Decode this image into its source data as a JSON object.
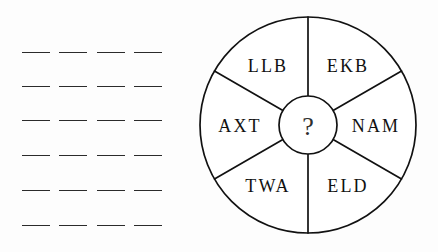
{
  "page": {
    "background_color": "#fdfdfd",
    "ink_color": "#111111"
  },
  "answer_blanks": {
    "label": "answer blanks",
    "rows": 6,
    "dashes_per_row": 4,
    "row_y": [
      52,
      86,
      120,
      155,
      190,
      225
    ],
    "left_x": 22,
    "row_width": 140,
    "dash_width": 28
  },
  "wheel": {
    "label": "word wheel",
    "center": {
      "x": 118,
      "y": 125
    },
    "outer_radius": 108,
    "hub_radius": 29,
    "hub": {
      "text": "?",
      "name": "question-mark"
    },
    "sectors": [
      {
        "name": "sector-ekb",
        "text": "EKB",
        "angle_deg": 60,
        "label_x": 158,
        "label_y": 66
      },
      {
        "name": "sector-nam",
        "text": "NAM",
        "angle_deg": 0,
        "label_x": 186,
        "label_y": 126
      },
      {
        "name": "sector-eld",
        "text": "ELD",
        "angle_deg": -60,
        "label_x": 158,
        "label_y": 186
      },
      {
        "name": "sector-twa",
        "text": "TWA",
        "angle_deg": -120,
        "label_x": 78,
        "label_y": 186
      },
      {
        "name": "sector-axt",
        "text": "AXT",
        "angle_deg": 180,
        "label_x": 50,
        "label_y": 126
      },
      {
        "name": "sector-llb",
        "text": "LLB",
        "angle_deg": 120,
        "label_x": 78,
        "label_y": 66
      }
    ],
    "spokes": [
      {
        "name": "spoke-top",
        "angle_deg": 90
      },
      {
        "name": "spoke-upper-right",
        "angle_deg": 30
      },
      {
        "name": "spoke-lower-right",
        "angle_deg": -30
      },
      {
        "name": "spoke-bottom",
        "angle_deg": -90
      },
      {
        "name": "spoke-lower-left",
        "angle_deg": -150
      },
      {
        "name": "spoke-upper-left",
        "angle_deg": 150
      }
    ]
  }
}
